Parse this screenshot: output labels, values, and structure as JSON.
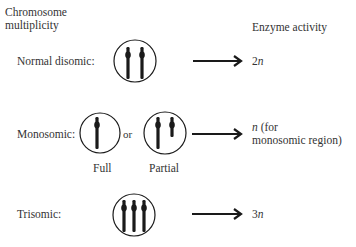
{
  "headers": {
    "left_line1": "Chromosome",
    "left_line2": "multiplicity",
    "right": "Enzyme activity"
  },
  "rows": [
    {
      "label": "Normal disomic:",
      "chromosomes": 2,
      "result_var": "2",
      "result_italic": "n",
      "result_rest": ""
    },
    {
      "label": "Monosomic:",
      "connector": "or",
      "variants": [
        {
          "caption": "Full",
          "chromosomes": 1
        },
        {
          "caption": "Partial",
          "chromosomes": 2,
          "one_partial": true
        }
      ],
      "result_italic": "n",
      "result_line1_rest": " (for",
      "result_line2": "monosomic region)"
    },
    {
      "label": "Trisomic:",
      "chromosomes": 3,
      "result_var": "3",
      "result_italic": "n"
    }
  ],
  "colors": {
    "ink": "#1a1a1a",
    "text": "#333333",
    "background": "#ffffff"
  }
}
